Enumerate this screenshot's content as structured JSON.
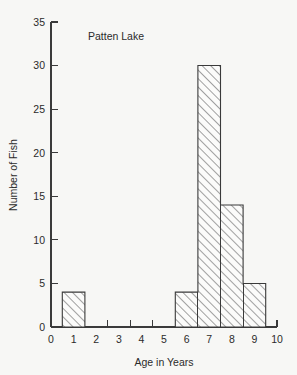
{
  "chart_data": {
    "type": "bar",
    "title": "Patten Lake",
    "xlabel": "Age in Years",
    "ylabel": "Number of Fish",
    "categories": [
      "1",
      "2",
      "3",
      "4",
      "5",
      "6",
      "7",
      "8",
      "9"
    ],
    "values": [
      4,
      0,
      0,
      0,
      0,
      4,
      30,
      14,
      5
    ],
    "bin_edges": [
      0.5,
      1.5,
      2.5,
      3.5,
      4.5,
      5.5,
      6.5,
      7.5,
      8.5,
      9.5
    ],
    "xlim": [
      0,
      10
    ],
    "ylim": [
      0,
      35
    ],
    "x_tick_labels": [
      "0",
      "1",
      "2",
      "3",
      "4",
      "5",
      "6",
      "7",
      "8",
      "9",
      "10"
    ],
    "x_tick_values": [
      0,
      1,
      2,
      3,
      4,
      5,
      6,
      7,
      8,
      9,
      10
    ],
    "x_tick_mark_values": [
      0.5,
      1.5,
      2.5,
      3.5,
      4.5,
      5.5,
      6.5,
      7.5,
      8.5,
      9.5
    ],
    "y_tick_labels": [
      "0",
      "5",
      "10",
      "15",
      "20",
      "25",
      "30",
      "35"
    ],
    "y_tick_values": [
      0,
      5,
      10,
      15,
      20,
      25,
      30,
      35
    ],
    "grid": false,
    "legend": "none",
    "fill_pattern": "diagonal-hatch-45",
    "line_color": "#3a3a3a",
    "background_color": "#f7f7f5"
  }
}
